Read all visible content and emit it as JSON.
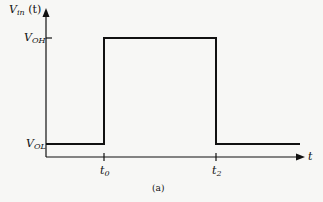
{
  "diagram": {
    "type": "waveform",
    "y_axis_label": {
      "main": "V",
      "sub": "in",
      "suffix": " (t)"
    },
    "x_axis_label": "t",
    "levels": [
      {
        "name": "V_OH",
        "main": "V",
        "sub": "OH"
      },
      {
        "name": "V_OL",
        "main": "V",
        "sub": "OL"
      }
    ],
    "time_marks": [
      {
        "name": "t0",
        "main": "t",
        "sub": "0"
      },
      {
        "name": "t2",
        "main": "t",
        "sub": "2"
      }
    ],
    "caption": "(a)",
    "line_color": "#111111"
  }
}
